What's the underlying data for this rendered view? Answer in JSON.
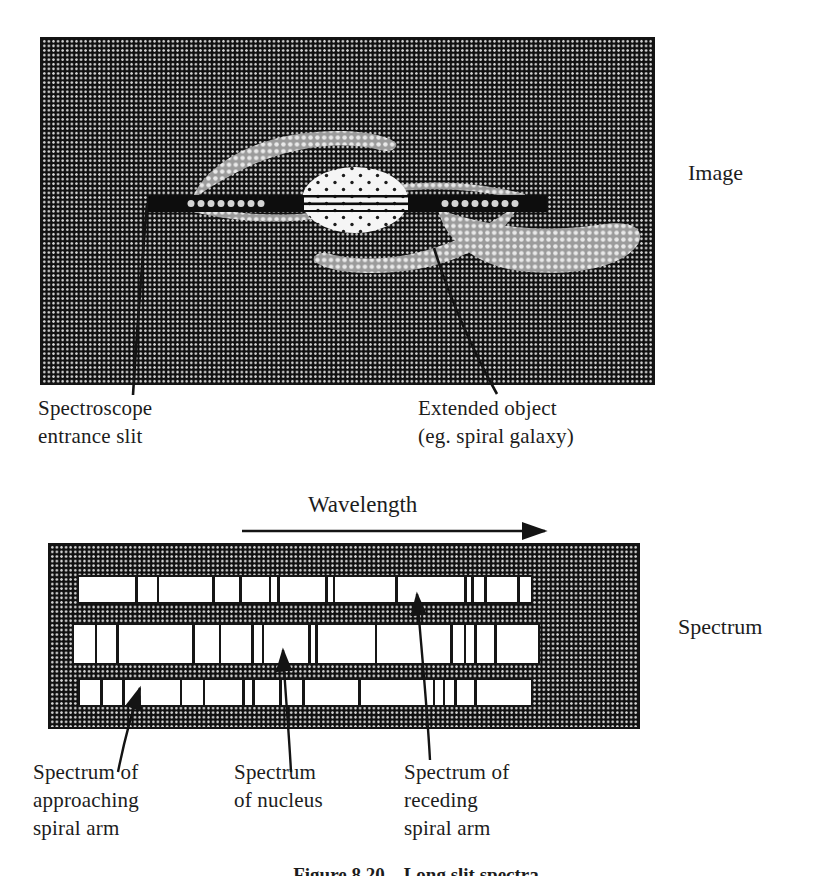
{
  "image_panel": {
    "side_label": "Image",
    "slit_label": {
      "line1": "Spectroscope",
      "line2": "entrance slit"
    },
    "object_label": {
      "line1": "Extended object",
      "line2": "(eg. spiral galaxy)"
    }
  },
  "spectrum_panel": {
    "side_label": "Spectrum",
    "wavelength_label": "Wavelength",
    "bands": [
      {
        "name": "spectrum of receding spiral arm",
        "lines": [
          0.127,
          0.175,
          0.298,
          0.357,
          0.423,
          0.441,
          0.548,
          0.564,
          0.702,
          0.855,
          0.871,
          0.899,
          0.972
        ]
      },
      {
        "name": "spectrum of nucleus",
        "lines": [
          0.047,
          0.094,
          0.257,
          0.315,
          0.385,
          0.407,
          0.508,
          0.522,
          0.651,
          0.814,
          0.843,
          0.865,
          0.908
        ]
      },
      {
        "name": "spectrum of approaching spiral arm",
        "lines": [
          0.048,
          0.097,
          0.224,
          0.275,
          0.363,
          0.385,
          0.444,
          0.495,
          0.62,
          0.785,
          0.807,
          0.833,
          0.877
        ]
      }
    ],
    "labels": {
      "approaching": {
        "line1": "Spectrum of",
        "line2": "approaching",
        "line3": "spiral arm"
      },
      "nucleus": {
        "line1": "Spectrum",
        "line2": "of nucleus"
      },
      "receding": {
        "line1": "Spectrum of",
        "line2": "receding",
        "line3": "spiral arm"
      }
    }
  },
  "caption": "Figure 8.20    Long slit spectra",
  "colors": {
    "ink": "#1c1c1c",
    "halftone_base": "#101010",
    "halftone_dot": "#d2d2d2",
    "arm_base": "#9b9b9b",
    "arm_dot": "#e9e9e9",
    "nucleus_base": "#f5f5f5",
    "paper": "#ffffff"
  }
}
